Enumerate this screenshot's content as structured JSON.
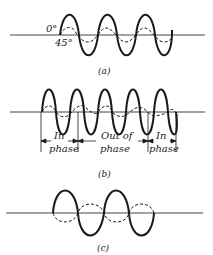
{
  "panels": {
    "a": {
      "caption": "(a)",
      "angle_solid_label": "0°",
      "angle_dashed_label": "45°"
    },
    "b": {
      "caption": "(b)",
      "regions": [
        {
          "line1": "In",
          "line2": "phase"
        },
        {
          "line1": "Out of",
          "line2": "phase"
        },
        {
          "line1": "In",
          "line2": "phase"
        }
      ]
    },
    "c": {
      "caption": "(c)"
    }
  },
  "colors": {
    "stroke": "#1a1a1a",
    "axis": "#444444",
    "background": "#ffffff"
  }
}
